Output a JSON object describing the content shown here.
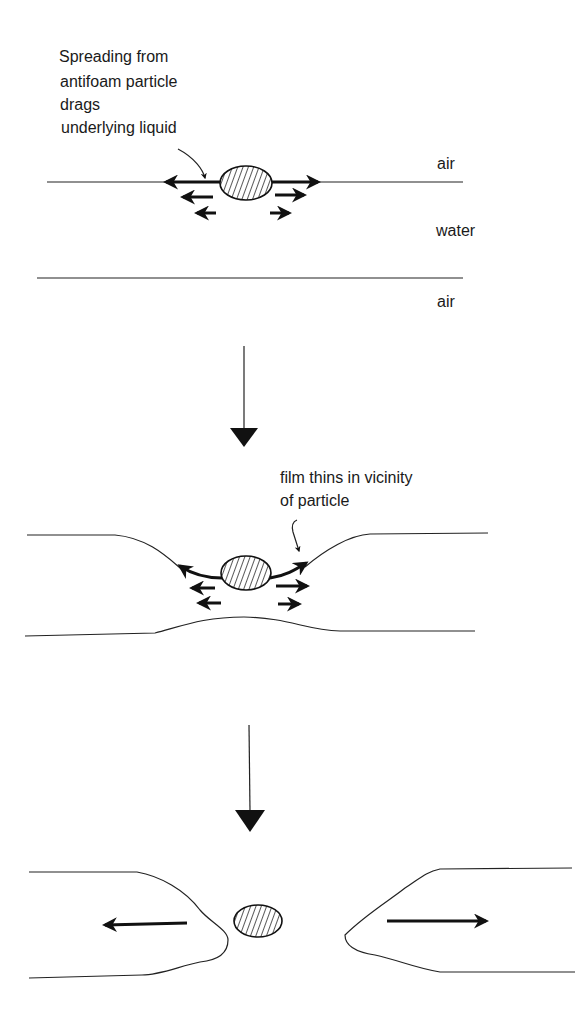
{
  "diagram": {
    "type": "process-diagram",
    "stages": [
      {
        "id": "stage-1",
        "annotation": [
          "Spreading from",
          "antifoam particle",
          "drags",
          "underlying liquid"
        ],
        "phase_labels": {
          "top": "air",
          "middle": "water",
          "bottom": "air"
        }
      },
      {
        "id": "stage-2",
        "annotation": [
          "film thins in vicinity",
          "of particle"
        ]
      },
      {
        "id": "stage-3",
        "annotation": []
      }
    ],
    "colors": {
      "ink": "#111111",
      "background": "#ffffff"
    }
  }
}
